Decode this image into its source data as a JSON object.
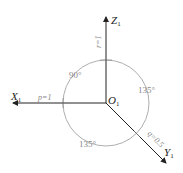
{
  "diagram": {
    "type": "axonometric-axes",
    "origin_label": "O",
    "origin_subscript": "1",
    "axes": [
      {
        "name": "X",
        "subscript": "1",
        "coefficient_label": "p=1"
      },
      {
        "name": "Y",
        "subscript": "1",
        "coefficient_label": "q=0.5"
      },
      {
        "name": "Z",
        "subscript": "1",
        "coefficient_label": "r=1"
      }
    ],
    "angles": [
      {
        "between": "X-Z",
        "label": "90°"
      },
      {
        "between": "Z-Y",
        "label": "135°"
      },
      {
        "between": "X-Y",
        "label": "135°"
      }
    ],
    "colors": {
      "axis": "#222222",
      "arc": "#999999",
      "label_grey": "#888888"
    }
  }
}
